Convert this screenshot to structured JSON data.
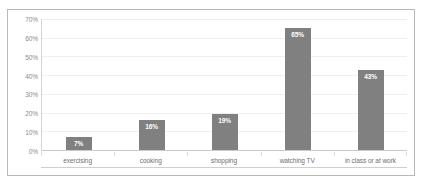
{
  "chart_data": {
    "type": "bar",
    "title": "",
    "subtitle": "",
    "xlabel": "",
    "ylabel": "",
    "categories": [
      "exercising",
      "cooking",
      "shopping",
      "watching TV",
      "in class or at work"
    ],
    "values": [
      7,
      16,
      19,
      65,
      43
    ],
    "data_labels": [
      "7%",
      "16%",
      "19%",
      "65%",
      "43%"
    ],
    "ylim": [
      0,
      70
    ],
    "ytick_values": [
      0,
      10,
      20,
      30,
      40,
      50,
      60,
      70
    ],
    "ytick_labels": [
      "0%",
      "10%",
      "20%",
      "30%",
      "40%",
      "50%",
      "60%",
      "70%"
    ],
    "grid": true,
    "grid_axis": "y",
    "legend": false,
    "legend_position": "none",
    "series": [
      {
        "name": "",
        "values": [
          7,
          16,
          19,
          65,
          43
        ]
      }
    ]
  },
  "style": {
    "bar_color": "#808080",
    "bar_label_color": "#ffffff",
    "gridline_color": "#efefef",
    "axis_color": "#c9c9c9",
    "tick_label_color": "#8a8a8a",
    "category_label_color": "#6e6e6e",
    "border_color": "#b9b9b9",
    "background": "#ffffff"
  }
}
